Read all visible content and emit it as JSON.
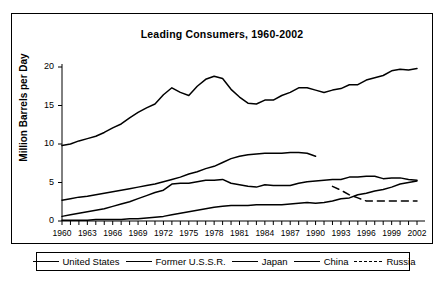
{
  "chart_data": {
    "type": "line",
    "title": "Leading Consumers, 1960-2002",
    "xlabel": "",
    "ylabel": "Million Barrels per Day",
    "xlim": [
      1960,
      2002
    ],
    "ylim": [
      0,
      20
    ],
    "yticks": [
      0,
      5,
      10,
      15,
      20
    ],
    "xticks": [
      1960,
      1963,
      1966,
      1969,
      1972,
      1975,
      1978,
      1981,
      1984,
      1987,
      1990,
      1993,
      1996,
      1999,
      2002
    ],
    "grid": false,
    "legend_position": "bottom",
    "x": [
      1960,
      1961,
      1962,
      1963,
      1964,
      1965,
      1966,
      1967,
      1968,
      1969,
      1970,
      1971,
      1972,
      1973,
      1974,
      1975,
      1976,
      1977,
      1978,
      1979,
      1980,
      1981,
      1982,
      1983,
      1984,
      1985,
      1986,
      1987,
      1988,
      1989,
      1990,
      1991,
      1992,
      1993,
      1994,
      1995,
      1996,
      1997,
      1998,
      1999,
      2000,
      2001,
      2002
    ],
    "series": [
      {
        "name": "United States",
        "style": "solid",
        "color": "#000000",
        "values": [
          9.8,
          10.0,
          10.4,
          10.7,
          11.0,
          11.5,
          12.1,
          12.6,
          13.4,
          14.1,
          14.7,
          15.2,
          16.4,
          17.3,
          16.7,
          16.3,
          17.5,
          18.4,
          18.8,
          18.5,
          17.1,
          16.1,
          15.3,
          15.2,
          15.7,
          15.7,
          16.3,
          16.7,
          17.3,
          17.3,
          17.0,
          16.7,
          17.0,
          17.2,
          17.7,
          17.7,
          18.3,
          18.6,
          18.9,
          19.5,
          19.7,
          19.6,
          19.8
        ]
      },
      {
        "name": "Former U.S.S.R.",
        "style": "solid",
        "color": "#000000",
        "values": [
          2.7,
          2.9,
          3.1,
          3.2,
          3.4,
          3.6,
          3.8,
          4.0,
          4.2,
          4.4,
          4.6,
          4.8,
          5.1,
          5.4,
          5.7,
          6.1,
          6.4,
          6.8,
          7.1,
          7.6,
          8.1,
          8.4,
          8.6,
          8.7,
          8.8,
          8.8,
          8.8,
          8.9,
          8.9,
          8.8,
          8.4,
          null,
          null,
          null,
          null,
          null,
          null,
          null,
          null,
          null,
          null,
          null,
          null
        ]
      },
      {
        "name": "Japan",
        "style": "solid",
        "color": "#000000",
        "values": [
          0.6,
          0.8,
          1.0,
          1.2,
          1.4,
          1.6,
          1.9,
          2.2,
          2.5,
          2.9,
          3.3,
          3.7,
          4.0,
          4.8,
          4.9,
          4.9,
          5.1,
          5.3,
          5.3,
          5.4,
          4.9,
          4.7,
          4.5,
          4.4,
          4.7,
          4.6,
          4.6,
          4.6,
          4.9,
          5.1,
          5.2,
          5.3,
          5.4,
          5.4,
          5.7,
          5.7,
          5.8,
          5.8,
          5.5,
          5.6,
          5.6,
          5.4,
          5.3
        ]
      },
      {
        "name": "China",
        "style": "solid",
        "color": "#000000",
        "values": [
          0.1,
          0.1,
          0.1,
          0.1,
          0.2,
          0.2,
          0.2,
          0.2,
          0.3,
          0.3,
          0.4,
          0.5,
          0.6,
          0.8,
          1.0,
          1.2,
          1.4,
          1.6,
          1.8,
          1.9,
          2.0,
          2.0,
          2.0,
          2.1,
          2.1,
          2.1,
          2.1,
          2.2,
          2.3,
          2.4,
          2.3,
          2.4,
          2.6,
          2.9,
          3.0,
          3.4,
          3.6,
          3.9,
          4.1,
          4.4,
          4.8,
          5.0,
          5.2
        ]
      },
      {
        "name": "Russia",
        "style": "dashed",
        "color": "#000000",
        "values": [
          null,
          null,
          null,
          null,
          null,
          null,
          null,
          null,
          null,
          null,
          null,
          null,
          null,
          null,
          null,
          null,
          null,
          null,
          null,
          null,
          null,
          null,
          null,
          null,
          null,
          null,
          null,
          null,
          null,
          null,
          null,
          null,
          4.5,
          4.0,
          3.4,
          3.0,
          2.6,
          2.6,
          2.6,
          2.6,
          2.6,
          2.6,
          2.6
        ]
      }
    ]
  },
  "legend": {
    "items": [
      {
        "label": "United States",
        "style": "solid"
      },
      {
        "label": "Former U.S.S.R.",
        "style": "solid"
      },
      {
        "label": "Japan",
        "style": "solid"
      },
      {
        "label": "China",
        "style": "solid"
      },
      {
        "label": "Russia",
        "style": "dashed"
      }
    ]
  }
}
